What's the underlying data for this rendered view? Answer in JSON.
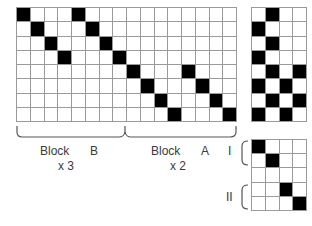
{
  "main_grid": {
    "rows": 8,
    "cols": 16,
    "filled": [
      [
        0,
        0
      ],
      [
        0,
        4
      ],
      [
        1,
        1
      ],
      [
        1,
        5
      ],
      [
        2,
        2
      ],
      [
        2,
        6
      ],
      [
        3,
        3
      ],
      [
        3,
        7
      ],
      [
        4,
        8
      ],
      [
        4,
        12
      ],
      [
        5,
        9
      ],
      [
        5,
        13
      ],
      [
        6,
        10
      ],
      [
        6,
        14
      ],
      [
        7,
        11
      ],
      [
        7,
        15
      ]
    ]
  },
  "right_grid": {
    "rows": 8,
    "cols": 4,
    "filled": [
      [
        0,
        1
      ],
      [
        1,
        0
      ],
      [
        2,
        1
      ],
      [
        3,
        0
      ],
      [
        4,
        1
      ],
      [
        4,
        3
      ],
      [
        5,
        0
      ],
      [
        5,
        2
      ],
      [
        6,
        1
      ],
      [
        6,
        3
      ],
      [
        7,
        0
      ],
      [
        7,
        2
      ]
    ]
  },
  "small_grid": {
    "rows": 5,
    "cols": 4,
    "filled": [
      [
        0,
        0
      ],
      [
        1,
        1
      ],
      [
        3,
        2
      ],
      [
        4,
        3
      ]
    ]
  },
  "labels": {
    "block_b": "Block",
    "block_b_letter": "B",
    "block_b_mult": "x 3",
    "block_a": "Block",
    "block_a_letter": "A",
    "block_a_mult": "x 2",
    "group_i": "I",
    "group_ii": "II"
  },
  "colors": {
    "filled": "#000000",
    "empty": "#ffffff",
    "gridline": "#9a9a9a",
    "bracket": "#555555"
  }
}
